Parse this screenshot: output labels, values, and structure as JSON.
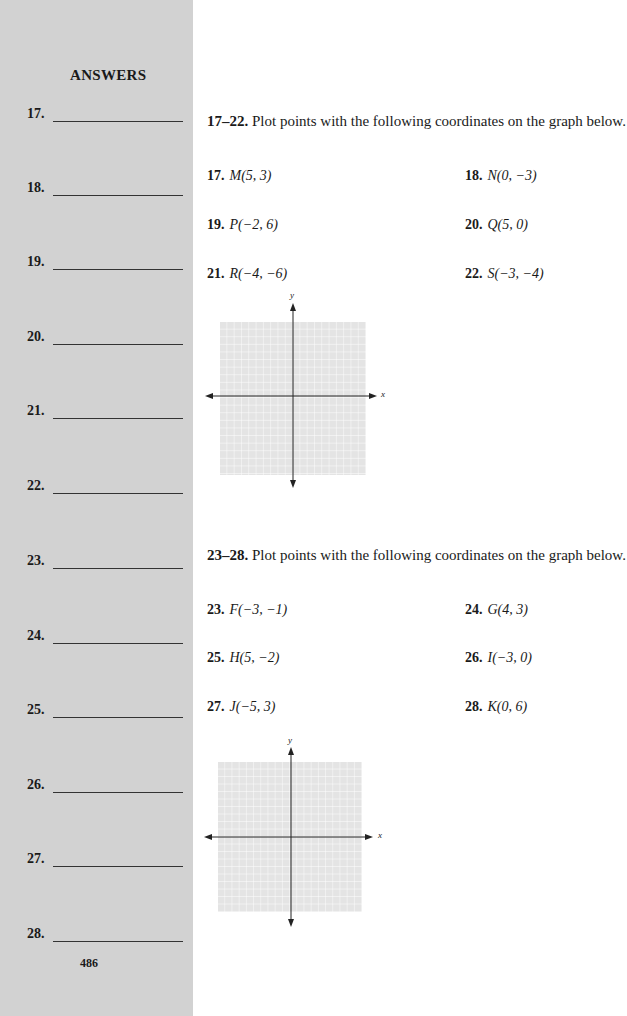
{
  "sidebar": {
    "title": "ANSWERS",
    "answers": [
      {
        "label": "17.",
        "value": ""
      },
      {
        "label": "18.",
        "value": ""
      },
      {
        "label": "19.",
        "value": ""
      },
      {
        "label": "20.",
        "value": ""
      },
      {
        "label": "21.",
        "value": ""
      },
      {
        "label": "22.",
        "value": ""
      },
      {
        "label": "23.",
        "value": ""
      },
      {
        "label": "24.",
        "value": ""
      },
      {
        "label": "25.",
        "value": ""
      },
      {
        "label": "26.",
        "value": ""
      },
      {
        "label": "27.",
        "value": ""
      },
      {
        "label": "28.",
        "value": ""
      }
    ],
    "page_number": "486"
  },
  "sections": [
    {
      "range": "17–22.",
      "instruction": " Plot points with the following coordinates on the graph below.",
      "problems": [
        {
          "num": "17.",
          "point": "M(5, 3)"
        },
        {
          "num": "18.",
          "point": "N(0, −3)"
        },
        {
          "num": "19.",
          "point": "P(−2, 6)"
        },
        {
          "num": "20.",
          "point": "Q(5, 0)"
        },
        {
          "num": "21.",
          "point": "R(−4, −6)"
        },
        {
          "num": "22.",
          "point": "S(−3, −4)"
        }
      ],
      "graph": {
        "x_label": "x",
        "y_label": "y"
      }
    },
    {
      "range": "23–28.",
      "instruction": " Plot points with the following coordinates on the graph below.",
      "problems": [
        {
          "num": "23.",
          "point": "F(−3, −1)"
        },
        {
          "num": "24.",
          "point": "G(4, 3)"
        },
        {
          "num": "25.",
          "point": "H(5, −2)"
        },
        {
          "num": "26.",
          "point": "I(−3, 0)"
        },
        {
          "num": "27.",
          "point": "J(−5, 3)"
        },
        {
          "num": "28.",
          "point": "K(0, 6)"
        }
      ],
      "graph": {
        "x_label": "x",
        "y_label": "y"
      }
    }
  ],
  "colors": {
    "sidebar_bg": "#d2d2d2",
    "grid_bg": "#e4e4e4",
    "grid_line": "#ffffff",
    "axis": "#222222"
  }
}
